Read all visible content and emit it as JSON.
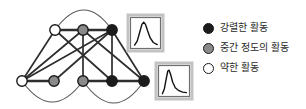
{
  "diagram": {
    "canvas": {
      "width": 306,
      "height": 109,
      "background": "#ffffff"
    },
    "node_radius": 5.2,
    "node_stroke_width": 1.4,
    "colors": {
      "intense": "#1c1c1c",
      "moderate": "#8a8a8a",
      "weak": "#ffffff",
      "node_stroke": "#1a1a1a",
      "edge": "#2e2e2e",
      "arc": "#5a5a5a",
      "box_fill": "#ffffff",
      "box_outer": "#c3c3c3",
      "box_inner": "#6e6e6e",
      "curve": "#111111"
    },
    "nodes": [
      {
        "id": "W1",
        "x": 55,
        "y": 30,
        "level": "weak"
      },
      {
        "id": "G1",
        "x": 83,
        "y": 30,
        "level": "moderate"
      },
      {
        "id": "B1",
        "x": 112,
        "y": 30,
        "level": "intense"
      },
      {
        "id": "W2",
        "x": 22,
        "y": 81,
        "level": "weak"
      },
      {
        "id": "G2",
        "x": 54,
        "y": 81,
        "level": "moderate"
      },
      {
        "id": "G3",
        "x": 83,
        "y": 81,
        "level": "moderate"
      },
      {
        "id": "B2",
        "x": 112,
        "y": 81,
        "level": "intense"
      },
      {
        "id": "B3",
        "x": 144,
        "y": 81,
        "level": "intense"
      }
    ],
    "edges": [
      {
        "from": "W1",
        "to": "G1",
        "w": 2.4
      },
      {
        "from": "G1",
        "to": "B1",
        "w": 2.4
      },
      {
        "from": "W2",
        "to": "G2",
        "w": 2.4
      },
      {
        "from": "G3",
        "to": "B2",
        "w": 2.4
      },
      {
        "from": "B2",
        "to": "B3",
        "w": 2.4
      },
      {
        "from": "W1",
        "to": "W2",
        "w": 1.7
      },
      {
        "from": "W1",
        "to": "B2",
        "w": 1.7
      },
      {
        "from": "G1",
        "to": "W2",
        "w": 1.7
      },
      {
        "from": "G1",
        "to": "G3",
        "w": 1.7
      },
      {
        "from": "G1",
        "to": "B3",
        "w": 1.7
      },
      {
        "from": "B1",
        "to": "W2",
        "w": 1.7
      },
      {
        "from": "B1",
        "to": "G2",
        "w": 1.7
      },
      {
        "from": "B1",
        "to": "B2",
        "w": 1.7
      },
      {
        "from": "B1",
        "to": "B3",
        "w": 1.7
      }
    ],
    "arcs": [
      {
        "from": "W1",
        "to": "B1",
        "cx": 84,
        "cy": -10,
        "w": 1.1
      },
      {
        "from": "W2",
        "to": "G3",
        "cx": 52,
        "cy": 123,
        "w": 1.1
      },
      {
        "from": "G3",
        "to": "B3",
        "cx": 114,
        "cy": 125,
        "w": 1.1
      }
    ],
    "curve_boxes": [
      {
        "name": "normal-distribution-curve",
        "x": 128,
        "y": 15,
        "w": 35,
        "h": 36,
        "points": [
          [
            0.08,
            0.95
          ],
          [
            0.18,
            0.8
          ],
          [
            0.27,
            0.5
          ],
          [
            0.36,
            0.18
          ],
          [
            0.43,
            0.1
          ],
          [
            0.5,
            0.18
          ],
          [
            0.58,
            0.42
          ],
          [
            0.68,
            0.68
          ],
          [
            0.8,
            0.85
          ],
          [
            0.95,
            0.93
          ]
        ]
      },
      {
        "name": "right-skewed-distribution-curve",
        "x": 156,
        "y": 63,
        "w": 36,
        "h": 36,
        "points": [
          [
            0.07,
            0.97
          ],
          [
            0.14,
            0.8
          ],
          [
            0.21,
            0.42
          ],
          [
            0.27,
            0.13
          ],
          [
            0.32,
            0.1
          ],
          [
            0.38,
            0.28
          ],
          [
            0.45,
            0.55
          ],
          [
            0.55,
            0.75
          ],
          [
            0.68,
            0.86
          ],
          [
            0.82,
            0.91
          ],
          [
            0.96,
            0.93
          ]
        ]
      }
    ]
  },
  "legend": {
    "items": [
      {
        "label": "강렬한 활동",
        "level": "intense"
      },
      {
        "label": "중간 정도의 활동",
        "level": "moderate"
      },
      {
        "label": "약한 활동",
        "level": "weak"
      }
    ]
  }
}
